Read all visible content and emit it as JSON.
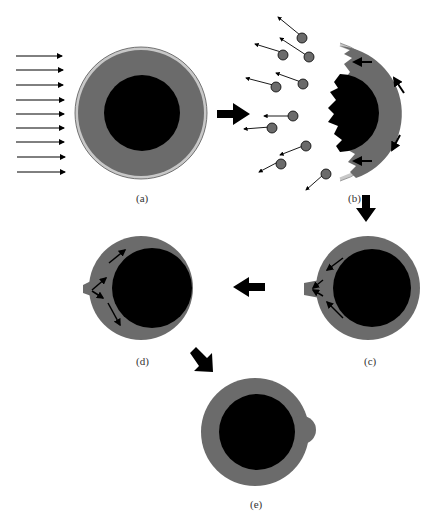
{
  "diagram": {
    "type": "process-sequence",
    "panels": [
      {
        "id": "a",
        "label": "(a)",
        "description": "Particle with core and outer shell under incoming parallel flux"
      },
      {
        "id": "b",
        "label": "(b)",
        "description": "Shell fragments ejected, core surface eroded, circulation arrows in shell"
      },
      {
        "id": "c",
        "label": "(c)",
        "description": "Shell material flows toward protrusion on left side"
      },
      {
        "id": "d",
        "label": "(d)",
        "description": "Protrusion redistributes material along shell"
      },
      {
        "id": "e",
        "label": "(e)",
        "description": "Restored core-shell particle with small bulge"
      }
    ],
    "flow_arrows": [
      "a->b",
      "b->c",
      "c->d",
      "d->e"
    ],
    "colors": {
      "core": "#000000",
      "shell": "#6b6b6b",
      "outer_layer": "#c8c8c8",
      "arrow": "#000000",
      "background": "#ffffff"
    },
    "incoming_arrow_count": 9,
    "ejected_fragment_count": 12
  }
}
